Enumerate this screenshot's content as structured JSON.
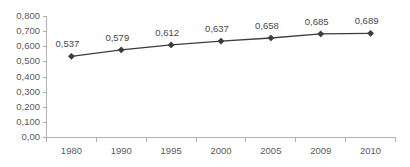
{
  "chart_data": {
    "type": "line",
    "title": "",
    "subtitle": "",
    "xlabel": "",
    "ylabel": "",
    "categories": [
      "1980",
      "1990",
      "1995",
      "2000",
      "2005",
      "2009",
      "2010"
    ],
    "values": [
      0.537,
      0.579,
      0.612,
      0.637,
      0.658,
      0.685,
      0.689
    ],
    "point_labels": [
      "0,537",
      "0,579",
      "0,612",
      "0,637",
      "0,658",
      "0,685",
      "0,689"
    ],
    "ylim": [
      0,
      0.8
    ],
    "ytick_values": [
      0,
      0.1,
      0.2,
      0.3,
      0.4,
      0.5,
      0.6,
      0.7,
      0.8
    ],
    "ytick_labels": [
      "0,00",
      "0,100",
      "0,200",
      "0,300",
      "0,400",
      "0,500",
      "0,600",
      "0,700",
      "0,800"
    ],
    "grid": false,
    "legend": null,
    "legend_position": "none",
    "decimal_separator": ",",
    "marker": "diamond",
    "colors": {
      "series_line": "#3c3c3c",
      "marker": "#3c3c3c",
      "axis": "#b0b0b0",
      "tick_text": "#5b5b5b",
      "label_text": "#4a4a4a",
      "background": "#ffffff"
    }
  }
}
